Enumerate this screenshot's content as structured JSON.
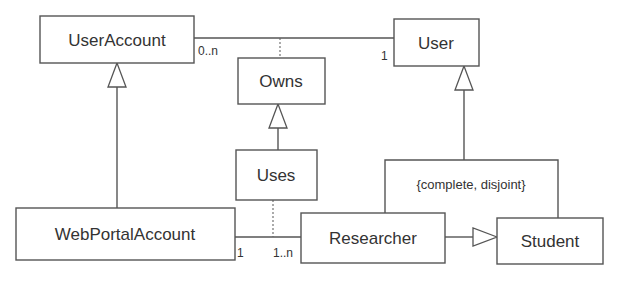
{
  "diagram": {
    "type": "UML class diagram",
    "classes": {
      "user_account": "UserAccount",
      "user": "User",
      "owns": "Owns",
      "uses": "Uses",
      "web_portal_account": "WebPortalAccount",
      "researcher": "Researcher",
      "student": "Student"
    },
    "multiplicities": {
      "user_account_end": "0..n",
      "user_end": "1",
      "web_portal_account_end": "1",
      "researcher_end": "1..n"
    },
    "constraint": "{complete, disjoint}",
    "colors": {
      "line": "#555555",
      "text": "#333333",
      "background": "#ffffff"
    }
  }
}
